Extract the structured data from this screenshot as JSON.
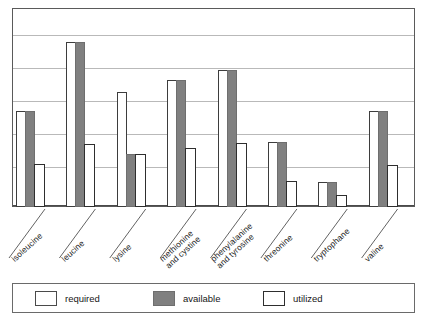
{
  "chart_data": {
    "type": "bar",
    "title": "",
    "subtitle": "",
    "xlabel": "",
    "ylabel": "",
    "ylim": [
      0,
      6
    ],
    "grid": true,
    "gridline_count": 6,
    "legend_position": "bottom",
    "categories": [
      "isoleucine",
      "leucine",
      "lysine",
      "methionine and cystine",
      "phenylalanine and tyrosine",
      "threonine",
      "tryptophane",
      "valine"
    ],
    "category_lines": [
      [
        "isoleucine"
      ],
      [
        "leucine"
      ],
      [
        "lysine"
      ],
      [
        "methionine",
        "and cystine"
      ],
      [
        "phenylalanine",
        "and tyrosine"
      ],
      [
        "threonine"
      ],
      [
        "tryptophane"
      ],
      [
        "valine"
      ]
    ],
    "series": [
      {
        "name": "required",
        "color": "#ffffff",
        "edge_color": "#3d3d3d",
        "values": [
          2.9,
          5.0,
          3.5,
          3.85,
          4.15,
          1.97,
          0.76,
          2.9
        ]
      },
      {
        "name": "available",
        "color": "#808080",
        "edge_color": "#6e6e6e",
        "values": [
          2.9,
          5.0,
          1.6,
          3.85,
          4.15,
          1.97,
          0.76,
          2.9
        ]
      },
      {
        "name": "utilized",
        "color": "#ffffff",
        "edge_color": "#2e2e2e",
        "values": [
          1.3,
          1.9,
          1.6,
          1.8,
          1.95,
          0.8,
          0.36,
          1.27
        ]
      }
    ]
  },
  "legend": {
    "items": [
      {
        "label": "required",
        "swatch": "required-swatch"
      },
      {
        "label": "available",
        "swatch": "available-swatch"
      },
      {
        "label": "utilized",
        "swatch": "utilized-swatch"
      }
    ]
  },
  "colors": {
    "bar_gray": "#808080",
    "grid": "#b9b9b9",
    "frame": "#5a5a5a",
    "text": "#161616",
    "background": "#ffffff"
  }
}
